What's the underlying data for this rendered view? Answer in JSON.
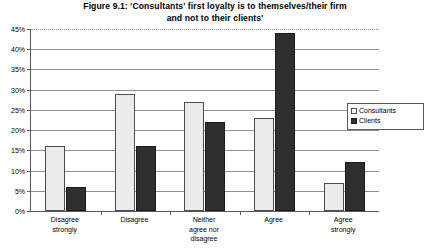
{
  "chart_data": {
    "type": "bar",
    "title": "Figure 9.1: 'Consultants' first loyalty is to themselves/their firm and not to their clients'",
    "title_line1": "Figure 9.1: 'Consultants' first loyalty is to themselves/their firm",
    "title_line2": "and not to their clients'",
    "categories": [
      "Disagree strongly",
      "Disagree",
      "Neither agree nor disagree",
      "Agree",
      "Agree strongly"
    ],
    "category_lines": [
      [
        "Disagree",
        "strongly"
      ],
      [
        "Disagree"
      ],
      [
        "Neither",
        "agree nor",
        "disagree"
      ],
      [
        "Agree"
      ],
      [
        "Agree",
        "strongly"
      ]
    ],
    "series": [
      {
        "name": "Consultants",
        "color": "#ebebeb",
        "values": [
          16,
          29,
          27,
          23,
          7
        ]
      },
      {
        "name": "Clients",
        "color": "#2f2f2f",
        "values": [
          6,
          16,
          22,
          44,
          12
        ]
      }
    ],
    "xlabel": "",
    "ylabel": "",
    "ylim": [
      0,
      45
    ],
    "ytick_step": 5,
    "ytick_labels": [
      "0%",
      "5%",
      "10%",
      "15%",
      "20%",
      "25%",
      "30%",
      "35%",
      "40%",
      "45%"
    ],
    "grid": true,
    "grid_top_dotted": true,
    "legend_position": "right-inside"
  },
  "legend": {
    "items": [
      {
        "label": "Consultants"
      },
      {
        "label": "Clients"
      }
    ]
  }
}
